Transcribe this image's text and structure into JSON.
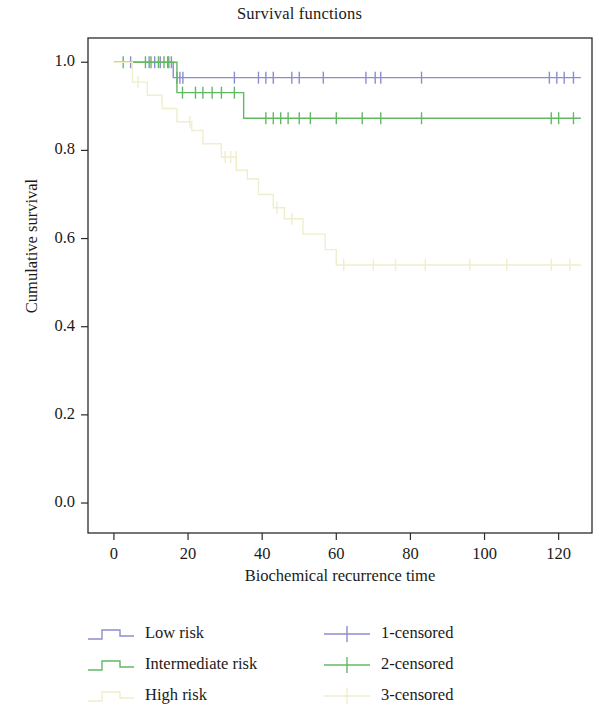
{
  "chart": {
    "title": "Survival functions",
    "xlabel": "Biochemical recurrence time",
    "ylabel": "Cumulative survival"
  },
  "legend": {
    "curves": [
      {
        "label": "Low risk",
        "color": "#8c8cd0",
        "key": "step-line-key"
      },
      {
        "label": "Intermediate risk",
        "color": "#63b863",
        "key": "step-line-key"
      },
      {
        "label": "High risk",
        "color": "#efeecd",
        "key": "step-line-key"
      }
    ],
    "censored": [
      {
        "label": "1-censored",
        "color": "#8c8cd0",
        "key": "plus-marker-key"
      },
      {
        "label": "2-censored",
        "color": "#63b863",
        "key": "plus-marker-key"
      },
      {
        "label": "3-censored",
        "color": "#efeecd",
        "key": "plus-marker-key"
      }
    ]
  },
  "chart_data": {
    "type": "line",
    "subtype": "kaplan-meier-step",
    "title": "Survival functions",
    "xlabel": "Biochemical recurrence time",
    "ylabel": "Cumulative survival",
    "xlim": [
      -7,
      129
    ],
    "ylim": [
      -0.068,
      1.055
    ],
    "xticks": [
      0,
      20,
      40,
      60,
      80,
      100,
      120
    ],
    "yticks": [
      0.0,
      0.2,
      0.4,
      0.6,
      0.8,
      1.0
    ],
    "ytick_labels": [
      "0.0",
      "0.2",
      "0.4",
      "0.6",
      "0.8",
      "1.0"
    ],
    "xtick_labels": [
      "0",
      "20",
      "40",
      "60",
      "80",
      "100",
      "120"
    ],
    "grid": false,
    "legend_position": "below-plot",
    "series": [
      {
        "name": "Low risk",
        "color": "#8c8cd0",
        "steps": [
          [
            0,
            1.0
          ],
          [
            16,
            1.0
          ],
          [
            16,
            0.965
          ],
          [
            126,
            0.965
          ]
        ],
        "censored_marks": [
          [
            4.5,
            1.0
          ],
          [
            9.5,
            1.0
          ],
          [
            11.0,
            1.0
          ],
          [
            12.5,
            1.0
          ],
          [
            14.5,
            1.0
          ],
          [
            15.5,
            1.0
          ],
          [
            17.0,
            0.965
          ],
          [
            17.8,
            0.965
          ],
          [
            18.6,
            0.965
          ],
          [
            32.5,
            0.965
          ],
          [
            39.0,
            0.965
          ],
          [
            41.0,
            0.965
          ],
          [
            43.0,
            0.965
          ],
          [
            48.0,
            0.965
          ],
          [
            50.0,
            0.965
          ],
          [
            56.5,
            0.965
          ],
          [
            68.0,
            0.965
          ],
          [
            70.5,
            0.965
          ],
          [
            72.0,
            0.965
          ],
          [
            83.0,
            0.965
          ],
          [
            117.5,
            0.965
          ],
          [
            119.5,
            0.965
          ],
          [
            121.5,
            0.965
          ],
          [
            124.0,
            0.965
          ]
        ]
      },
      {
        "name": "Intermediate risk",
        "color": "#63b863",
        "steps": [
          [
            0,
            1.0
          ],
          [
            17,
            1.0
          ],
          [
            17,
            0.931
          ],
          [
            35,
            0.931
          ],
          [
            35,
            0.873
          ],
          [
            126,
            0.873
          ]
        ],
        "censored_marks": [
          [
            2.5,
            1.0
          ],
          [
            8.5,
            1.0
          ],
          [
            10.0,
            1.0
          ],
          [
            12.0,
            1.0
          ],
          [
            13.5,
            1.0
          ],
          [
            14.8,
            1.0
          ],
          [
            18.5,
            0.931
          ],
          [
            22.0,
            0.931
          ],
          [
            24.0,
            0.931
          ],
          [
            26.5,
            0.931
          ],
          [
            29.0,
            0.931
          ],
          [
            32.5,
            0.931
          ],
          [
            41.0,
            0.873
          ],
          [
            43.0,
            0.873
          ],
          [
            45.0,
            0.873
          ],
          [
            47.0,
            0.873
          ],
          [
            50.0,
            0.873
          ],
          [
            53.0,
            0.873
          ],
          [
            60.0,
            0.873
          ],
          [
            67.0,
            0.873
          ],
          [
            72.0,
            0.873
          ],
          [
            83.0,
            0.873
          ],
          [
            118.0,
            0.873
          ],
          [
            120.0,
            0.873
          ],
          [
            124.0,
            0.873
          ]
        ]
      },
      {
        "name": "High risk",
        "color": "#efeecd",
        "steps": [
          [
            0,
            1.0
          ],
          [
            5,
            1.0
          ],
          [
            5,
            0.955
          ],
          [
            9,
            0.955
          ],
          [
            9,
            0.925
          ],
          [
            13,
            0.925
          ],
          [
            13,
            0.895
          ],
          [
            17,
            0.895
          ],
          [
            17,
            0.865
          ],
          [
            21,
            0.865
          ],
          [
            21,
            0.845
          ],
          [
            24,
            0.845
          ],
          [
            24,
            0.815
          ],
          [
            29,
            0.815
          ],
          [
            29,
            0.785
          ],
          [
            33,
            0.785
          ],
          [
            33,
            0.755
          ],
          [
            36,
            0.755
          ],
          [
            36,
            0.735
          ],
          [
            39,
            0.735
          ],
          [
            39,
            0.7
          ],
          [
            43,
            0.7
          ],
          [
            43,
            0.67
          ],
          [
            46,
            0.67
          ],
          [
            46,
            0.645
          ],
          [
            51,
            0.645
          ],
          [
            51,
            0.61
          ],
          [
            57,
            0.61
          ],
          [
            57,
            0.575
          ],
          [
            60,
            0.575
          ],
          [
            60,
            0.54
          ],
          [
            126,
            0.54
          ]
        ],
        "censored_marks": [
          [
            6.5,
            0.955
          ],
          [
            20.5,
            0.865
          ],
          [
            30.0,
            0.785
          ],
          [
            31.5,
            0.785
          ],
          [
            33.0,
            0.785
          ],
          [
            44.0,
            0.67
          ],
          [
            48.0,
            0.645
          ],
          [
            62.0,
            0.54
          ],
          [
            70.0,
            0.54
          ],
          [
            76.0,
            0.54
          ],
          [
            84.0,
            0.54
          ],
          [
            96.0,
            0.54
          ],
          [
            106.0,
            0.54
          ],
          [
            118.0,
            0.54
          ],
          [
            123.0,
            0.54
          ]
        ]
      }
    ]
  }
}
